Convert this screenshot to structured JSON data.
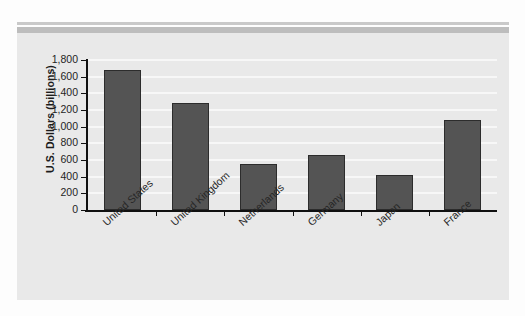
{
  "figure": {
    "background_color": "#fdfdfd",
    "panel_color": "#e9e9e9",
    "rule_color": "#bdbdbd"
  },
  "chart_data": {
    "type": "bar",
    "title": "",
    "subtitle": "",
    "xlabel": "",
    "ylabel": "U.S. Dollars (billions)",
    "categories": [
      "United States",
      "United Kingdom",
      "Netherlands",
      "Germany",
      "Japan",
      "France"
    ],
    "values": [
      1680,
      1290,
      550,
      660,
      420,
      1080
    ],
    "ylim": [
      0,
      1800
    ],
    "ytick_values": [
      0,
      200,
      400,
      600,
      800,
      1000,
      1200,
      1400,
      1600,
      1800
    ],
    "ytick_labels": [
      "0",
      "200",
      "400",
      "600",
      "800",
      "1,000",
      "1,200",
      "1,400",
      "1,600",
      "1,800"
    ],
    "grid": true,
    "grid_orientation": "horizontal",
    "grid_color": "#f7f7f7",
    "legend": false,
    "legend_position": "none",
    "bar_color": "#545454",
    "bar_edge_color": "#2c2c2c",
    "axis_color": "#101010",
    "xtick_label_rotation": -42
  }
}
